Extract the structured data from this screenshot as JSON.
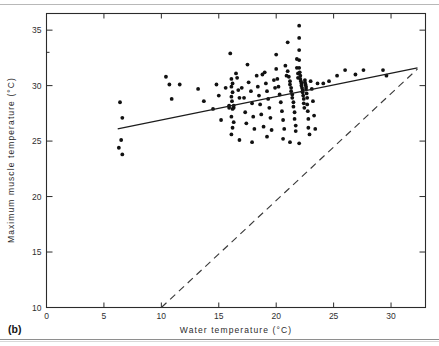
{
  "figure": {
    "panel_label": "(b)",
    "background": "#ffffff",
    "ink_color": "#1a1a1a"
  },
  "chart_data": {
    "type": "scatter",
    "title": "",
    "xlabel": "Water   temperature   (°C)",
    "ylabel": "Maximum  muscle  temperature  (°C)",
    "xlim": [
      0,
      33
    ],
    "ylim": [
      10,
      36.5
    ],
    "xticks": [
      0,
      5,
      10,
      15,
      20,
      25,
      30
    ],
    "yticks": [
      10,
      15,
      20,
      25,
      30,
      35
    ],
    "xticklabels": [
      "0",
      "5",
      "10",
      "15",
      "20",
      "25",
      "30"
    ],
    "yticklabels": [
      "10",
      "15",
      "20",
      "25",
      "30",
      "35"
    ],
    "grid": false,
    "legend": "none",
    "frame": "box-with-inward-ticks",
    "series": [
      {
        "name": "Maximum muscle temperature vs water temperature",
        "marker": "filled-circle",
        "color": "#111111",
        "points": [
          [
            6.4,
            28.5
          ],
          [
            6.6,
            27.1
          ],
          [
            6.5,
            25.1
          ],
          [
            6.3,
            24.4
          ],
          [
            6.6,
            23.8
          ],
          [
            10.4,
            30.8
          ],
          [
            10.7,
            30.1
          ],
          [
            10.9,
            28.8
          ],
          [
            11.6,
            30.1
          ],
          [
            13.7,
            28.6
          ],
          [
            14.5,
            27.9
          ],
          [
            15.0,
            29.1
          ],
          [
            15.2,
            26.9
          ],
          [
            15.9,
            28.2
          ],
          [
            15.9,
            28.0
          ],
          [
            16.3,
            28.2
          ],
          [
            16.3,
            28.0
          ],
          [
            16.0,
            32.9
          ],
          [
            16.1,
            30.6
          ],
          [
            16.2,
            30.2
          ],
          [
            16.1,
            29.9
          ],
          [
            16.2,
            29.4
          ],
          [
            16.1,
            29.0
          ],
          [
            16.15,
            28.6
          ],
          [
            16.2,
            27.9
          ],
          [
            16.1,
            27.2
          ],
          [
            16.3,
            26.7
          ],
          [
            16.2,
            26.2
          ],
          [
            16.1,
            25.6
          ],
          [
            16.5,
            31.1
          ],
          [
            16.6,
            30.7
          ],
          [
            16.7,
            29.6
          ],
          [
            16.8,
            28.9
          ],
          [
            17.0,
            29.8
          ],
          [
            17.2,
            28.9
          ],
          [
            17.3,
            27.6
          ],
          [
            17.4,
            26.6
          ],
          [
            17.6,
            30.3
          ],
          [
            17.8,
            29.5
          ],
          [
            17.9,
            28.4
          ],
          [
            18.0,
            27.2
          ],
          [
            18.1,
            26.1
          ],
          [
            18.3,
            30.9
          ],
          [
            18.4,
            29.9
          ],
          [
            18.5,
            29.1
          ],
          [
            18.6,
            28.3
          ],
          [
            18.7,
            27.4
          ],
          [
            18.9,
            26.3
          ],
          [
            19.0,
            31.2
          ],
          [
            19.1,
            30.2
          ],
          [
            19.2,
            29.5
          ],
          [
            19.3,
            28.8
          ],
          [
            19.4,
            28.0
          ],
          [
            19.5,
            27.1
          ],
          [
            19.6,
            26.0
          ],
          [
            19.8,
            30.5
          ],
          [
            19.9,
            29.8
          ],
          [
            20.0,
            31.5
          ],
          [
            20.1,
            30.6
          ],
          [
            20.2,
            29.9
          ],
          [
            20.3,
            29.2
          ],
          [
            20.4,
            28.5
          ],
          [
            20.5,
            27.7
          ],
          [
            20.6,
            26.9
          ],
          [
            20.7,
            26.1
          ],
          [
            20.8,
            31.8
          ],
          [
            20.9,
            30.9
          ],
          [
            21.0,
            33.9
          ],
          [
            21.0,
            31.3
          ],
          [
            21.1,
            30.8
          ],
          [
            21.2,
            30.4
          ],
          [
            21.2,
            30.1
          ],
          [
            21.3,
            29.8
          ],
          [
            21.3,
            29.5
          ],
          [
            21.4,
            29.2
          ],
          [
            21.4,
            28.9
          ],
          [
            21.5,
            28.5
          ],
          [
            21.5,
            28.1
          ],
          [
            21.6,
            27.6
          ],
          [
            21.6,
            27.0
          ],
          [
            21.7,
            26.4
          ],
          [
            21.7,
            25.9
          ],
          [
            21.8,
            32.4
          ],
          [
            21.8,
            31.6
          ],
          [
            21.9,
            31.1
          ],
          [
            21.9,
            30.7
          ],
          [
            22.0,
            35.4
          ],
          [
            22.0,
            34.3
          ],
          [
            22.0,
            33.2
          ],
          [
            22.0,
            32.3
          ],
          [
            22.0,
            31.6
          ],
          [
            22.05,
            31.2
          ],
          [
            22.1,
            30.9
          ],
          [
            22.1,
            30.6
          ],
          [
            22.15,
            30.4
          ],
          [
            22.2,
            30.2
          ],
          [
            22.2,
            30.0
          ],
          [
            22.25,
            29.8
          ],
          [
            22.3,
            29.6
          ],
          [
            22.3,
            29.4
          ],
          [
            22.35,
            29.1
          ],
          [
            22.4,
            28.8
          ],
          [
            22.4,
            28.4
          ],
          [
            22.45,
            28.0
          ],
          [
            22.5,
            30.5
          ],
          [
            22.5,
            30.3
          ],
          [
            22.55,
            30.1
          ],
          [
            22.6,
            29.9
          ],
          [
            22.6,
            29.7
          ],
          [
            22.65,
            29.3
          ],
          [
            22.7,
            28.9
          ],
          [
            22.7,
            28.3
          ],
          [
            22.75,
            27.7
          ],
          [
            22.8,
            27.0
          ],
          [
            22.8,
            26.2
          ],
          [
            22.9,
            25.6
          ],
          [
            23.0,
            30.4
          ],
          [
            23.1,
            29.7
          ],
          [
            23.2,
            28.6
          ],
          [
            23.3,
            27.3
          ],
          [
            23.4,
            26.1
          ],
          [
            23.6,
            30.2
          ],
          [
            24.1,
            30.2
          ],
          [
            24.6,
            30.4
          ],
          [
            25.3,
            30.9
          ],
          [
            26.0,
            31.4
          ],
          [
            26.9,
            31.0
          ],
          [
            27.6,
            31.4
          ],
          [
            29.3,
            31.4
          ],
          [
            29.6,
            30.9
          ],
          [
            17.5,
            31.9
          ],
          [
            18.8,
            31.0
          ],
          [
            20.0,
            32.8
          ],
          [
            19.2,
            25.4
          ],
          [
            20.6,
            25.2
          ],
          [
            22.0,
            24.8
          ],
          [
            16.8,
            25.1
          ],
          [
            17.9,
            24.9
          ],
          [
            21.2,
            24.9
          ],
          [
            15.6,
            29.8
          ],
          [
            14.8,
            30.1
          ],
          [
            13.2,
            29.7
          ]
        ]
      }
    ],
    "fit_line": {
      "name": "regression line",
      "style": "solid",
      "color": "#1c1c1c",
      "x_start": 6.2,
      "y_start": 26.1,
      "x_end": 32.3,
      "y_end": 31.6
    },
    "reference_line": {
      "name": "isothermal line (muscle = water)",
      "style": "dashed",
      "color": "#3a3a3a",
      "x_start": 10.0,
      "y_start": 10.0,
      "x_end": 32.3,
      "y_end": 31.5
    }
  }
}
